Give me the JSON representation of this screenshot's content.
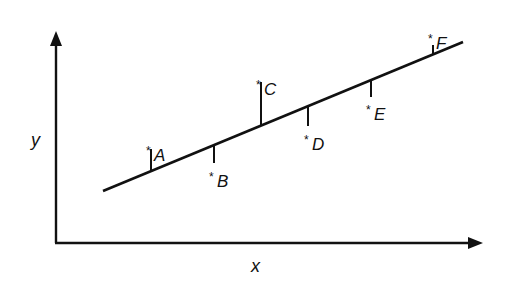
{
  "diagram": {
    "type": "scatter-with-regression-line",
    "axes": {
      "x_label": "x",
      "y_label": "y"
    },
    "regression_line": {
      "x1": 103,
      "y1": 191,
      "x2": 463,
      "y2": 42
    },
    "points": [
      {
        "id": "A",
        "star": "*",
        "label": "A",
        "x": 151,
        "y_line": 171,
        "y_point": 148,
        "direction": "above"
      },
      {
        "id": "B",
        "star": "*",
        "label": "B",
        "x": 214,
        "y_line": 145,
        "y_point": 163,
        "direction": "below"
      },
      {
        "id": "C",
        "star": "*",
        "label": "C",
        "x": 261,
        "y_line": 125,
        "y_point": 82,
        "direction": "above"
      },
      {
        "id": "D",
        "star": "*",
        "label": "D",
        "x": 308,
        "y_line": 106,
        "y_point": 126,
        "direction": "below"
      },
      {
        "id": "E",
        "star": "*",
        "label": "E",
        "x": 371,
        "y_line": 80,
        "y_point": 97,
        "direction": "below"
      },
      {
        "id": "F",
        "star": "*",
        "label": "F",
        "x": 433,
        "y_line": 54,
        "y_point": 44,
        "direction": "above"
      }
    ],
    "colors": {
      "ink": "#111111",
      "background": "#ffffff"
    }
  }
}
